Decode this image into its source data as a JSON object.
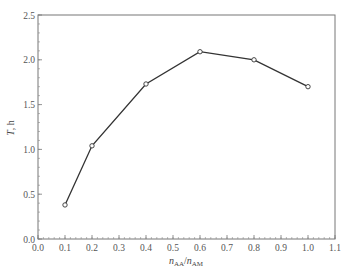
{
  "chart_data": {
    "type": "line",
    "title": "",
    "xlabel": "n_AA/n_AM",
    "xlabel_parts": {
      "n1": "n",
      "sub1": "AA",
      "slash": "/",
      "n2": "n",
      "sub2": "AM"
    },
    "ylabel": "T, h",
    "ylabel_parts": {
      "var": "T",
      "unit": ", h"
    },
    "xlim": [
      0.0,
      1.1
    ],
    "ylim": [
      0.0,
      2.5
    ],
    "x_ticks": [
      "0.0",
      "0.1",
      "0.2",
      "0.3",
      "0.4",
      "0.5",
      "0.6",
      "0.7",
      "0.8",
      "0.9",
      "1.0",
      "1.1"
    ],
    "y_ticks": [
      "0.0",
      "0.5",
      "1.0",
      "1.5",
      "2.0",
      "2.5"
    ],
    "grid": false,
    "legend": null,
    "marker": "open-circle",
    "series": [
      {
        "name": "T",
        "x": [
          0.1,
          0.2,
          0.4,
          0.6,
          0.8,
          1.0
        ],
        "y": [
          0.38,
          1.04,
          1.73,
          2.09,
          2.0,
          1.7
        ]
      }
    ]
  }
}
